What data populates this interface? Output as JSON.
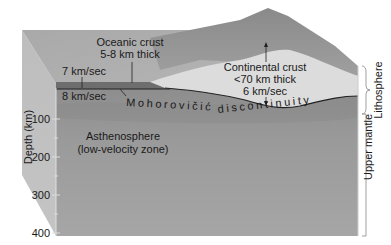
{
  "diagram": {
    "oceanic_crust": {
      "line1": "Oceanic crust",
      "line2": "5-8 km thick",
      "velocity": "7 km/sec"
    },
    "mantle_velocity": "8 km/sec",
    "continental_crust": {
      "line1": "Continental crust",
      "line2": "<70 km thick",
      "line3": "6 km/sec"
    },
    "moho": {
      "part1": "Mohorovičić",
      "part2": "discontinuity"
    },
    "asthenosphere": {
      "line1": "Asthenosphere",
      "line2": "(low-velocity zone)"
    },
    "depth_axis": {
      "label": "Depth (km)",
      "ticks": [
        "100",
        "200",
        "300",
        "400"
      ]
    },
    "right_labels": {
      "lithosphere": "Lithosphere",
      "upper_mantle": "Upper mantle"
    }
  }
}
